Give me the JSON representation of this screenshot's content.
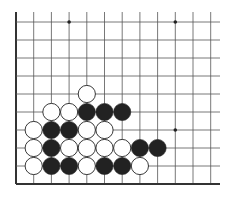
{
  "board": {
    "description": "Go problem diagram, lower-left corner",
    "columns": 12,
    "rows": 10,
    "origin_x": 16,
    "origin_y": 22,
    "spacing_x": 17.7,
    "spacing_y": 18.0,
    "right_extent": 220,
    "top_extent": 12,
    "edges": [
      "left",
      "bottom"
    ],
    "star_points": [
      [
        3,
        0
      ],
      [
        9,
        0
      ],
      [
        9,
        6
      ]
    ],
    "colors": {
      "black": "#222222",
      "white": "#ffffff",
      "line": "#555555",
      "edge": "#333333"
    },
    "stones": [
      {
        "col": 4,
        "row": 4,
        "color": "white"
      },
      {
        "col": 2,
        "row": 5,
        "color": "white"
      },
      {
        "col": 3,
        "row": 5,
        "color": "white"
      },
      {
        "col": 4,
        "row": 5,
        "color": "black"
      },
      {
        "col": 5,
        "row": 5,
        "color": "black"
      },
      {
        "col": 6,
        "row": 5,
        "color": "black"
      },
      {
        "col": 1,
        "row": 6,
        "color": "white"
      },
      {
        "col": 2,
        "row": 6,
        "color": "black"
      },
      {
        "col": 3,
        "row": 6,
        "color": "black"
      },
      {
        "col": 4,
        "row": 6,
        "color": "white"
      },
      {
        "col": 5,
        "row": 6,
        "color": "white"
      },
      {
        "col": 1,
        "row": 7,
        "color": "white"
      },
      {
        "col": 2,
        "row": 7,
        "color": "black"
      },
      {
        "col": 3,
        "row": 7,
        "color": "white"
      },
      {
        "col": 4,
        "row": 7,
        "color": "white"
      },
      {
        "col": 5,
        "row": 7,
        "color": "white"
      },
      {
        "col": 6,
        "row": 7,
        "color": "white"
      },
      {
        "col": 7,
        "row": 7,
        "color": "black"
      },
      {
        "col": 8,
        "row": 7,
        "color": "black"
      },
      {
        "col": 1,
        "row": 8,
        "color": "white"
      },
      {
        "col": 2,
        "row": 8,
        "color": "black"
      },
      {
        "col": 3,
        "row": 8,
        "color": "black"
      },
      {
        "col": 4,
        "row": 8,
        "color": "white"
      },
      {
        "col": 5,
        "row": 8,
        "color": "black"
      },
      {
        "col": 6,
        "row": 8,
        "color": "black"
      },
      {
        "col": 7,
        "row": 8,
        "color": "white"
      }
    ]
  }
}
